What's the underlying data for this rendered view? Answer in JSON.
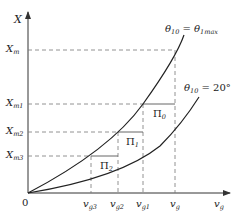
{
  "diagram": {
    "y_axis": {
      "label": "X",
      "sub": ""
    },
    "x_axis": {
      "label": "v",
      "sub": "g"
    },
    "origin": "0",
    "y_ticks": [
      {
        "label": "X",
        "sub": "m"
      },
      {
        "label": "X",
        "sub": "m1"
      },
      {
        "label": "X",
        "sub": "m2"
      },
      {
        "label": "X",
        "sub": "m3"
      }
    ],
    "x_ticks": [
      {
        "label": "v",
        "sub": "g3"
      },
      {
        "label": "v",
        "sub": "g2"
      },
      {
        "label": "v",
        "sub": "g1"
      },
      {
        "label": "v",
        "sub": "g"
      }
    ],
    "curves": [
      {
        "name": "theta-max-curve",
        "label_lhs": "θ",
        "lhs_sub": "10",
        "eq": " = ",
        "label_rhs": "θ",
        "rhs_sub": "1max"
      },
      {
        "name": "theta-20-curve",
        "label_lhs": "θ",
        "lhs_sub": "10",
        "eq": " = ",
        "value": "20°"
      }
    ],
    "regions": [
      {
        "label": "Π",
        "sub": "0"
      },
      {
        "label": "Π",
        "sub": "1"
      },
      {
        "label": "Π",
        "sub": "2"
      }
    ],
    "colors": {
      "line": "#333333",
      "dash": "#777777"
    }
  }
}
